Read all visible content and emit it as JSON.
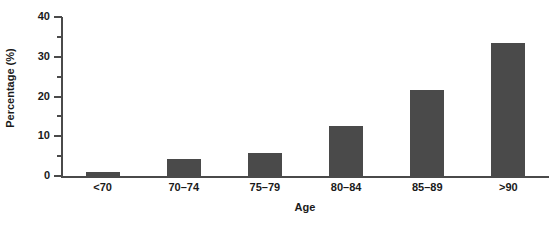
{
  "chart_data": {
    "type": "bar",
    "title": "",
    "xlabel": "Age",
    "ylabel": "Percentage (%)",
    "categories": [
      "<70",
      "70–74",
      "75–79",
      "80–84",
      "85–89",
      ">90"
    ],
    "values": [
      1.0,
      4.3,
      5.8,
      12.6,
      21.6,
      33.5
    ],
    "ylim": [
      0,
      40
    ],
    "y_major_ticks": [
      0,
      10,
      20,
      30,
      40
    ],
    "y_minor_ticks": [
      5,
      15,
      25,
      35
    ],
    "y_tick_labels": [
      "0",
      "10",
      "20",
      "30",
      "40"
    ],
    "grid": false,
    "legend": null,
    "bar_color": "#4a4a4a",
    "axis_color": "#4a4a4a",
    "text_color": "#1a1a1a",
    "background": "#ffffff"
  }
}
